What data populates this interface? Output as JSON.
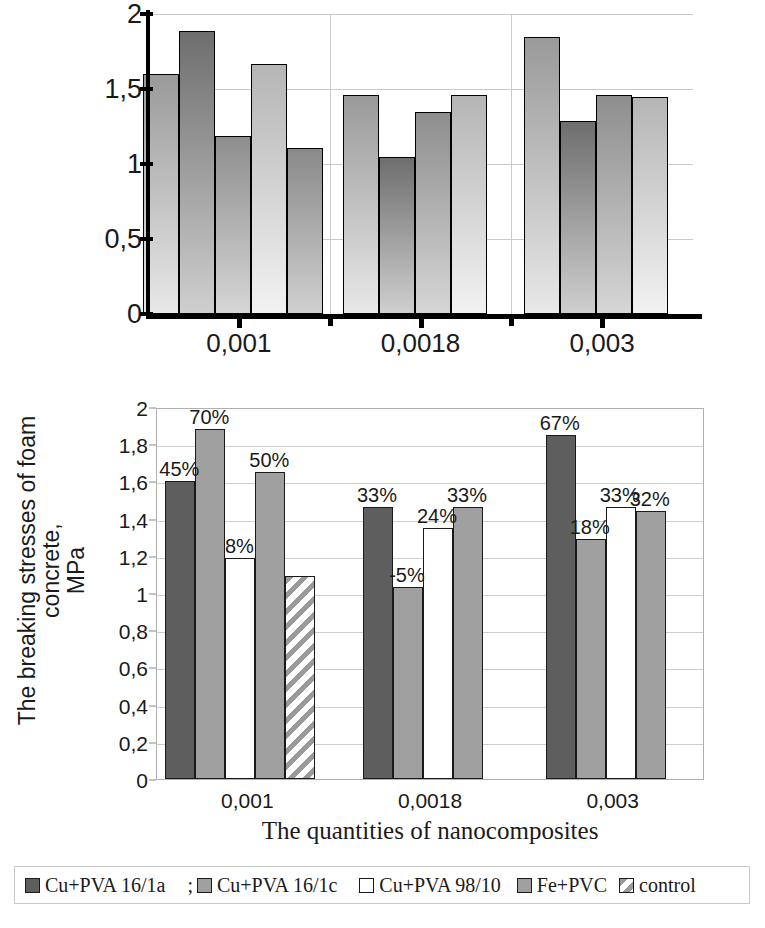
{
  "chart_data": [
    {
      "type": "bar",
      "id": "top-chart",
      "title": "",
      "xlabel": "",
      "ylabel": "",
      "categories": [
        "0,001",
        "0,0018",
        "0,003"
      ],
      "ylim": [
        0,
        2
      ],
      "yticks": [
        "0",
        "0,5",
        "1",
        "1,5",
        "2"
      ],
      "ytick_values": [
        0,
        0.5,
        1,
        1.5,
        2
      ],
      "grid": true,
      "legend": "none",
      "series": [
        {
          "name": "Cu+PVA 16/1a",
          "values": [
            1.6,
            1.46,
            1.85
          ]
        },
        {
          "name": "Cu+PVA 16/1c",
          "values": [
            1.89,
            1.05,
            1.29
          ]
        },
        {
          "name": "Cu+PVA 98/10",
          "values": [
            1.19,
            1.35,
            1.46
          ]
        },
        {
          "name": "Fe+PVC",
          "values": [
            1.67,
            1.46,
            1.45
          ]
        },
        {
          "name": "control",
          "values": [
            1.11,
            null,
            null
          ]
        }
      ]
    },
    {
      "type": "bar",
      "id": "bottom-chart",
      "title": "",
      "xlabel": "The quantities of nanocomposites",
      "ylabel": "The breaking stresses of foam concrete, MPa",
      "ylabel_line1": "The breaking stresses of foam concrete,",
      "ylabel_line2": "MPa",
      "categories": [
        "0,001",
        "0,0018",
        "0,003"
      ],
      "ylim": [
        0,
        2
      ],
      "yticks": [
        "0",
        "0,2",
        "0,4",
        "0,6",
        "0,8",
        "1",
        "1,2",
        "1,4",
        "1,6",
        "1,8",
        "2"
      ],
      "ytick_values": [
        0,
        0.2,
        0.4,
        0.6,
        0.8,
        1,
        1.2,
        1.4,
        1.6,
        1.8,
        2
      ],
      "grid": true,
      "legend": "bottom",
      "series": [
        {
          "name": "Cu+PVA 16/1a",
          "color": "#5e5e5e",
          "pattern": "solid",
          "values": [
            1.6,
            1.46,
            1.85
          ],
          "labels": [
            "45%",
            "33%",
            "67%"
          ]
        },
        {
          "name": "Cu+PVA 16/1c",
          "color": "#a0a0a0",
          "pattern": "solid",
          "values": [
            1.88,
            1.03,
            1.29
          ],
          "labels": [
            "70%",
            "-5%",
            "18%"
          ]
        },
        {
          "name": "Cu+PVA 98/10",
          "color": "#ffffff",
          "pattern": "solid",
          "values": [
            1.19,
            1.35,
            1.46
          ],
          "labels": [
            "8%",
            "24%",
            "33%"
          ]
        },
        {
          "name": "Fe+PVC",
          "color": "#a0a0a0",
          "pattern": "solid",
          "values": [
            1.65,
            1.46,
            1.44
          ],
          "labels": [
            "50%",
            "33%",
            "32%"
          ]
        },
        {
          "name": "control",
          "color": "#ffffff",
          "pattern": "diagonal-hatch",
          "values": [
            1.09,
            null,
            null
          ],
          "labels": [
            "",
            "",
            ""
          ]
        }
      ]
    }
  ],
  "legend": {
    "separator": ";",
    "items": [
      {
        "label": "Cu+PVA 16/1a",
        "swatch": "dark-gray-swatch"
      },
      {
        "label": "Cu+PVA 16/1c",
        "swatch": "mid-gray-swatch"
      },
      {
        "label": "Cu+PVA 98/10",
        "swatch": "white-swatch"
      },
      {
        "label": "Fe+PVC",
        "swatch": "mid-gray-swatch"
      },
      {
        "label": "control",
        "swatch": "hatch-swatch"
      }
    ]
  },
  "colors": {
    "series_dark": "#5e5e5e",
    "series_mid": "#a0a0a0",
    "series_white": "#ffffff",
    "hatch_stripe": "#9a9a9a",
    "axis": "#000000",
    "gridline": "#cfcfcf",
    "plot_border": "#b0b0b0"
  }
}
